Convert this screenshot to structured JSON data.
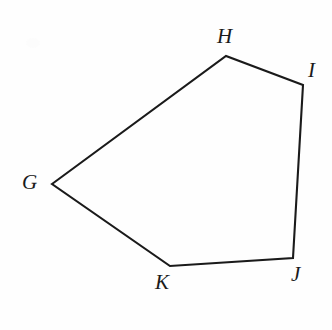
{
  "figure": {
    "kind": "geometry-diagram",
    "shape_name": "pentagon",
    "canvas": {
      "width": 332,
      "height": 330,
      "background": "#fefefe"
    },
    "stroke": {
      "color": "#1a1a1a",
      "width": 2.1
    },
    "vertices": [
      {
        "id": "G",
        "label": "G",
        "x": 52,
        "y": 184,
        "label_x": 22,
        "label_y": 172
      },
      {
        "id": "H",
        "label": "H",
        "x": 226,
        "y": 56,
        "label_x": 217,
        "label_y": 26
      },
      {
        "id": "I",
        "label": "I",
        "x": 303,
        "y": 85,
        "label_x": 308,
        "label_y": 60
      },
      {
        "id": "J",
        "label": "J",
        "x": 293,
        "y": 258,
        "label_x": 291,
        "label_y": 264
      },
      {
        "id": "K",
        "label": "K",
        "x": 170,
        "y": 266,
        "label_x": 155,
        "label_y": 272
      }
    ],
    "edges": [
      {
        "from": "G",
        "to": "H"
      },
      {
        "from": "H",
        "to": "I"
      },
      {
        "from": "I",
        "to": "J"
      },
      {
        "from": "J",
        "to": "K"
      },
      {
        "from": "K",
        "to": "G"
      }
    ],
    "artifact": {
      "present": true,
      "description": "faint-scan-smudge"
    }
  }
}
